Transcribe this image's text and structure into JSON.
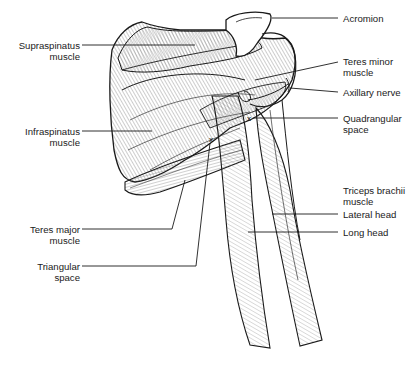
{
  "figure": {
    "line_color": "#1a1a1a",
    "background": "#ffffff"
  },
  "labels_left": [
    {
      "id": "supraspinatus",
      "lines": [
        "Supraspinatus",
        "muscle"
      ]
    },
    {
      "id": "infraspinatus",
      "lines": [
        "Infraspinatus",
        "muscle"
      ]
    },
    {
      "id": "teres-major",
      "lines": [
        "Teres major",
        "muscle"
      ]
    },
    {
      "id": "triangular-space",
      "lines": [
        "Triangular",
        "space"
      ]
    }
  ],
  "labels_right": [
    {
      "id": "acromion",
      "lines": [
        "Acromion"
      ]
    },
    {
      "id": "teres-minor",
      "lines": [
        "Teres minor",
        "muscle"
      ]
    },
    {
      "id": "axillary-nerve",
      "lines": [
        "Axillary nerve"
      ]
    },
    {
      "id": "quadrangular-space",
      "lines": [
        "Quadrangular",
        "space"
      ]
    },
    {
      "id": "triceps-brachii",
      "lines": [
        "Triceps brachii",
        "muscle"
      ]
    },
    {
      "id": "lateral-head",
      "lines": [
        "Lateral head"
      ]
    },
    {
      "id": "long-head",
      "lines": [
        "Long head"
      ]
    }
  ],
  "markers": [
    {
      "id": "quadrangular-space-marker",
      "symbol": "x"
    },
    {
      "id": "triangular-space-marker",
      "symbol": "x"
    }
  ]
}
